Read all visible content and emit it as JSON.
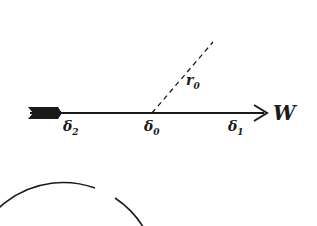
{
  "diagram": {
    "type": "circle-with-axis",
    "colors": {
      "stroke": "#1a1a1a",
      "background": "#ffffff"
    },
    "circle": {
      "cx": 152,
      "cy": 113,
      "r": 94,
      "gap": "bottom-left"
    },
    "axis": {
      "label": "W",
      "direction": "right"
    },
    "radius_label": {
      "base": "r",
      "sub": "0"
    },
    "points": [
      {
        "id": "delta2",
        "base": "δ",
        "sub": "2"
      },
      {
        "id": "delta0",
        "base": "δ",
        "sub": "0"
      },
      {
        "id": "delta1",
        "base": "δ",
        "sub": "1"
      }
    ]
  }
}
